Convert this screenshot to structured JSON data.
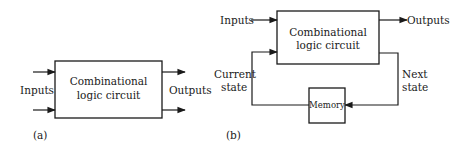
{
  "diagram_a": {
    "caption": "(a)",
    "block_line1": "Combinational",
    "block_line2": "logic circuit",
    "inputs_label": "Inputs",
    "outputs_label": "Outputs"
  },
  "diagram_b": {
    "caption": "(b)",
    "block_line1": "Combinational",
    "block_line2": "logic circuit",
    "inputs_label": "Inputs",
    "outputs_label": "Outputs",
    "current_state_line1": "Current",
    "current_state_line2": "state",
    "next_state_line1": "Next",
    "next_state_line2": "state",
    "memory_label": "Memory"
  }
}
